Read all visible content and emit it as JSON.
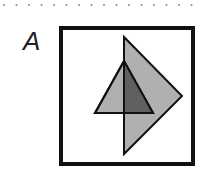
{
  "figure": {
    "label": "A",
    "frame": {
      "x": 61,
      "y": 28,
      "width": 132,
      "height": 136,
      "stroke": "#111111",
      "stroke_width": 4
    },
    "kite": {
      "points": "124,37 182,96 124,154",
      "fill": "#b0b0b0",
      "stroke": "#111111"
    },
    "triangle": {
      "points": "124,61 95,113 153,113",
      "fill": "#b0b0b0",
      "stroke": "#111111"
    },
    "overlap": {
      "points": "124,61 124,113 153,113",
      "fill": "#606060"
    },
    "dots": {
      "count": 16,
      "spacing": 12.5,
      "y": 5,
      "color": "#888888"
    }
  }
}
